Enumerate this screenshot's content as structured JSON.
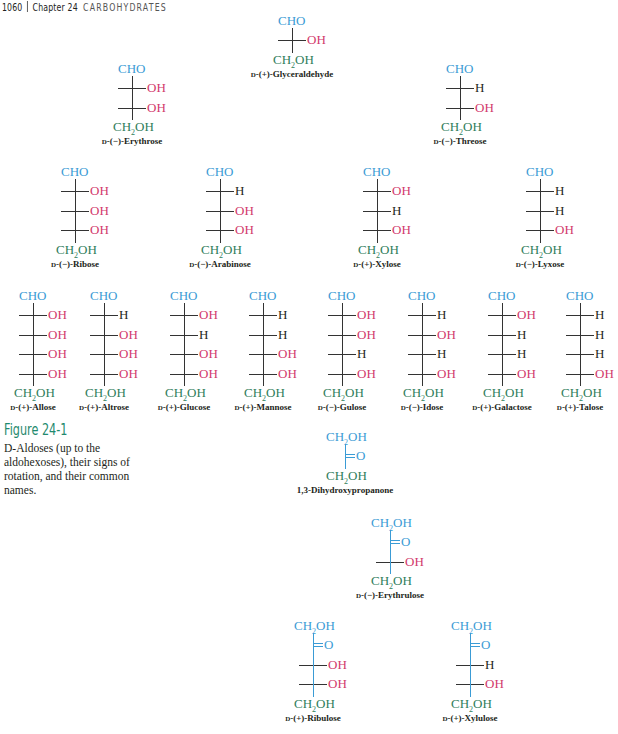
{
  "header": {
    "page_number": "1060",
    "chapter": "Chapter 24",
    "chapter_title": "CARBOHYDRATES"
  },
  "colors": {
    "carbonyl": "#3a9bd5",
    "hydroxyl": "#d2386c",
    "hydrogen": "#231f20",
    "terminal_ch2oh": "#2e7d5b"
  },
  "caption": {
    "figure_label": "Figure 24-1",
    "text": "D-Aldoses (up to the aldohexoses), their signs of rotation, and their common names."
  },
  "aldoses": [
    {
      "name": "D-(+)-Glyceraldehyde",
      "top": "CHO",
      "rows": [
        [
          "H",
          "OH"
        ]
      ],
      "bottom": "CH2OH"
    },
    {
      "name": "D-(−)-Erythrose",
      "top": "CHO",
      "rows": [
        [
          "H",
          "OH"
        ],
        [
          "H",
          "OH"
        ]
      ],
      "bottom": "CH2OH"
    },
    {
      "name": "D-(−)-Threose",
      "top": "CHO",
      "rows": [
        [
          "HO",
          "H"
        ],
        [
          "H",
          "OH"
        ]
      ],
      "bottom": "CH2OH"
    },
    {
      "name": "D-(−)-Ribose",
      "top": "CHO",
      "rows": [
        [
          "H",
          "OH"
        ],
        [
          "H",
          "OH"
        ],
        [
          "H",
          "OH"
        ]
      ],
      "bottom": "CH2OH"
    },
    {
      "name": "D-(−)-Arabinose",
      "top": "CHO",
      "rows": [
        [
          "HO",
          "H"
        ],
        [
          "H",
          "OH"
        ],
        [
          "H",
          "OH"
        ]
      ],
      "bottom": "CH2OH"
    },
    {
      "name": "D-(+)-Xylose",
      "top": "CHO",
      "rows": [
        [
          "H",
          "OH"
        ],
        [
          "HO",
          "H"
        ],
        [
          "H",
          "OH"
        ]
      ],
      "bottom": "CH2OH"
    },
    {
      "name": "D-(−)-Lyxose",
      "top": "CHO",
      "rows": [
        [
          "HO",
          "H"
        ],
        [
          "HO",
          "H"
        ],
        [
          "H",
          "OH"
        ]
      ],
      "bottom": "CH2OH"
    },
    {
      "name": "D-(+)-Allose",
      "top": "CHO",
      "rows": [
        [
          "H",
          "OH"
        ],
        [
          "H",
          "OH"
        ],
        [
          "H",
          "OH"
        ],
        [
          "H",
          "OH"
        ]
      ],
      "bottom": "CH2OH"
    },
    {
      "name": "D-(+)-Altrose",
      "top": "CHO",
      "rows": [
        [
          "HO",
          "H"
        ],
        [
          "H",
          "OH"
        ],
        [
          "H",
          "OH"
        ],
        [
          "H",
          "OH"
        ]
      ],
      "bottom": "CH2OH"
    },
    {
      "name": "D-(+)-Glucose",
      "top": "CHO",
      "rows": [
        [
          "H",
          "OH"
        ],
        [
          "HO",
          "H"
        ],
        [
          "H",
          "OH"
        ],
        [
          "H",
          "OH"
        ]
      ],
      "bottom": "CH2OH"
    },
    {
      "name": "D-(+)-Mannose",
      "top": "CHO",
      "rows": [
        [
          "HO",
          "H"
        ],
        [
          "HO",
          "H"
        ],
        [
          "H",
          "OH"
        ],
        [
          "H",
          "OH"
        ]
      ],
      "bottom": "CH2OH"
    },
    {
      "name": "D-(−)-Gulose",
      "top": "CHO",
      "rows": [
        [
          "H",
          "OH"
        ],
        [
          "H",
          "OH"
        ],
        [
          "HO",
          "H"
        ],
        [
          "H",
          "OH"
        ]
      ],
      "bottom": "CH2OH"
    },
    {
      "name": "D-(−)-Idose",
      "top": "CHO",
      "rows": [
        [
          "HO",
          "H"
        ],
        [
          "H",
          "OH"
        ],
        [
          "HO",
          "H"
        ],
        [
          "H",
          "OH"
        ]
      ],
      "bottom": "CH2OH"
    },
    {
      "name": "D-(+)-Galactose",
      "top": "CHO",
      "rows": [
        [
          "H",
          "OH"
        ],
        [
          "HO",
          "H"
        ],
        [
          "HO",
          "H"
        ],
        [
          "H",
          "OH"
        ]
      ],
      "bottom": "CH2OH"
    },
    {
      "name": "D-(+)-Talose",
      "top": "CHO",
      "rows": [
        [
          "HO",
          "H"
        ],
        [
          "HO",
          "H"
        ],
        [
          "HO",
          "H"
        ],
        [
          "H",
          "OH"
        ]
      ],
      "bottom": "CH2OH"
    }
  ],
  "ketoses": [
    {
      "name": "1,3-Dihydroxypropanone",
      "top": "CH2OH",
      "carbonyl": "O",
      "rows": [],
      "bottom": "CH2OH"
    },
    {
      "name": "D-(−)-Erythrulose",
      "top": "CH2OH",
      "carbonyl": "O",
      "rows": [
        [
          "H",
          "OH"
        ]
      ],
      "bottom": "CH2OH"
    },
    {
      "name": "D-(+)-Ribulose",
      "top": "CH2OH",
      "carbonyl": "O",
      "rows": [
        [
          "H",
          "OH"
        ],
        [
          "H",
          "OH"
        ]
      ],
      "bottom": "CH2OH"
    },
    {
      "name": "D-(+)-Xylulose",
      "top": "CH2OH",
      "carbonyl": "O",
      "rows": [
        [
          "HO",
          "H"
        ],
        [
          "H",
          "OH"
        ]
      ],
      "bottom": "CH2OH"
    }
  ]
}
